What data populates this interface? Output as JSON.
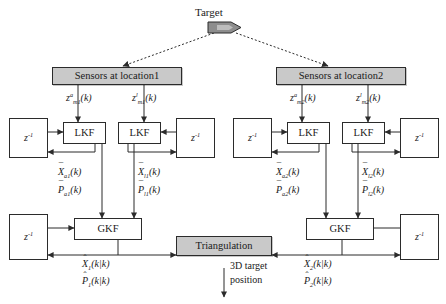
{
  "diagram": {
    "title_node": "Target",
    "sensors": [
      {
        "id": "loc1",
        "label": "Sensors at location1"
      },
      {
        "id": "loc2",
        "label": "Sensors at location2"
      }
    ],
    "measurements": [
      {
        "id": "z_a_m1",
        "base": "z",
        "sup": "a",
        "sub": "m1",
        "arg": "(k)"
      },
      {
        "id": "z_l_m1",
        "base": "z",
        "sup": "l",
        "sub": "m1",
        "arg": "(k)"
      },
      {
        "id": "z_a_m2",
        "base": "z",
        "sup": "a",
        "sub": "m2",
        "arg": "(k)"
      },
      {
        "id": "z_l_m2",
        "base": "z",
        "sup": "l",
        "sub": "m2",
        "arg": "(k)"
      }
    ],
    "filters": [
      {
        "id": "lkf-a1",
        "label": "LKF"
      },
      {
        "id": "lkf-l1",
        "label": "LKF"
      },
      {
        "id": "lkf-a2",
        "label": "LKF"
      },
      {
        "id": "lkf-l2",
        "label": "LKF"
      }
    ],
    "delays": [
      {
        "id": "z-inv-1",
        "base": "z",
        "sup": "-1"
      },
      {
        "id": "z-inv-2",
        "base": "z",
        "sup": "-1"
      },
      {
        "id": "z-inv-3",
        "base": "z",
        "sup": "-1"
      },
      {
        "id": "z-inv-4",
        "base": "z",
        "sup": "-1"
      },
      {
        "id": "z-inv-5",
        "base": "z",
        "sup": "-1"
      },
      {
        "id": "z-inv-6",
        "base": "z",
        "sup": "-1"
      }
    ],
    "lkf_outputs": [
      {
        "id": "out-a1",
        "x_base": "X",
        "x_sub": "a1",
        "p_base": "P",
        "p_sub": "a1",
        "arg": "(k)"
      },
      {
        "id": "out-l1",
        "x_base": "X",
        "x_sub": "l1",
        "p_base": "P",
        "p_sub": "l1",
        "arg": "(k)"
      },
      {
        "id": "out-a2",
        "x_base": "X",
        "x_sub": "a2",
        "p_base": "P",
        "p_sub": "a2",
        "arg": "(k)"
      },
      {
        "id": "out-l2",
        "x_base": "X",
        "x_sub": "l2",
        "p_base": "P",
        "p_sub": "l2",
        "arg": "(k)"
      }
    ],
    "fusers": [
      {
        "id": "gkf1",
        "label": "GKF"
      },
      {
        "id": "gkf2",
        "label": "GKF"
      }
    ],
    "gkf_outputs": [
      {
        "id": "gout1",
        "x_base": "X",
        "x_sub": "1",
        "p_base": "P",
        "p_sub": "1",
        "arg": "(k|k)"
      },
      {
        "id": "gout2",
        "x_base": "X",
        "x_sub": "2",
        "p_base": "P",
        "p_sub": "2",
        "arg": "(k|k)"
      }
    ],
    "triangulation": {
      "label": "Triangulation"
    },
    "final_output": {
      "line1": "3D target",
      "line2": "position"
    },
    "colors": {
      "box_fill": "#c9c9c9",
      "stroke": "#2b2b2b",
      "canvas": "#ffffff"
    }
  }
}
